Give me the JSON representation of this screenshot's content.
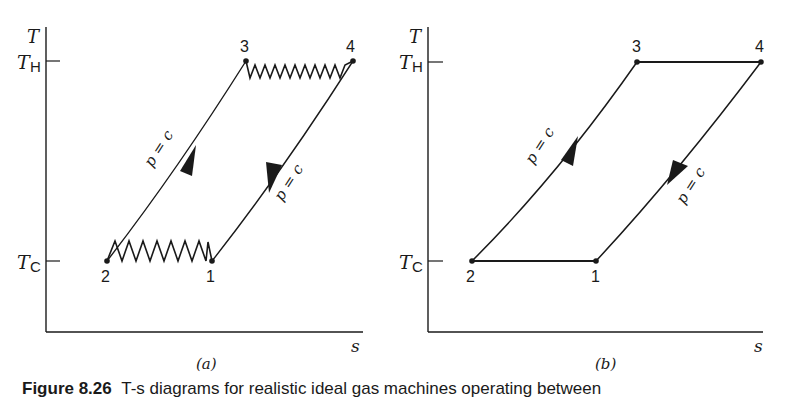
{
  "figure": {
    "caption_label": "Figure 8.26",
    "caption_text": "T-s diagrams for realistic ideal gas machines operating between",
    "panels": [
      {
        "id": "a",
        "label": "(a)",
        "y_axis_label": "T",
        "x_axis_label": "s",
        "ticks": [
          {
            "name": "T",
            "sub": "H",
            "level": "hot"
          },
          {
            "name": "T",
            "sub": "C",
            "level": "cold"
          }
        ],
        "points": [
          {
            "label": "1",
            "position": "lower-right"
          },
          {
            "label": "2",
            "position": "lower-left"
          },
          {
            "label": "3",
            "position": "upper-left"
          },
          {
            "label": "4",
            "position": "upper-right"
          }
        ],
        "process_labels": [
          {
            "from": "2",
            "to": "3",
            "text": "p = c",
            "direction": "up"
          },
          {
            "from": "4",
            "to": "1",
            "text": "p = c",
            "direction": "down"
          }
        ],
        "heat_exchange_style": "zigzag (irreversible)"
      },
      {
        "id": "b",
        "label": "(b)",
        "y_axis_label": "T",
        "x_axis_label": "s",
        "ticks": [
          {
            "name": "T",
            "sub": "H",
            "level": "hot"
          },
          {
            "name": "T",
            "sub": "C",
            "level": "cold"
          }
        ],
        "points": [
          {
            "label": "1",
            "position": "lower-right"
          },
          {
            "label": "2",
            "position": "lower-left"
          },
          {
            "label": "3",
            "position": "upper-left"
          },
          {
            "label": "4",
            "position": "upper-right"
          }
        ],
        "process_labels": [
          {
            "from": "2",
            "to": "3",
            "text": "p = c",
            "direction": "up"
          },
          {
            "from": "4",
            "to": "1",
            "text": "p = c",
            "direction": "down"
          }
        ],
        "heat_exchange_style": "straight (isothermal)"
      }
    ]
  },
  "colors": {
    "ink": "#1a1a1a",
    "background": "#ffffff"
  }
}
